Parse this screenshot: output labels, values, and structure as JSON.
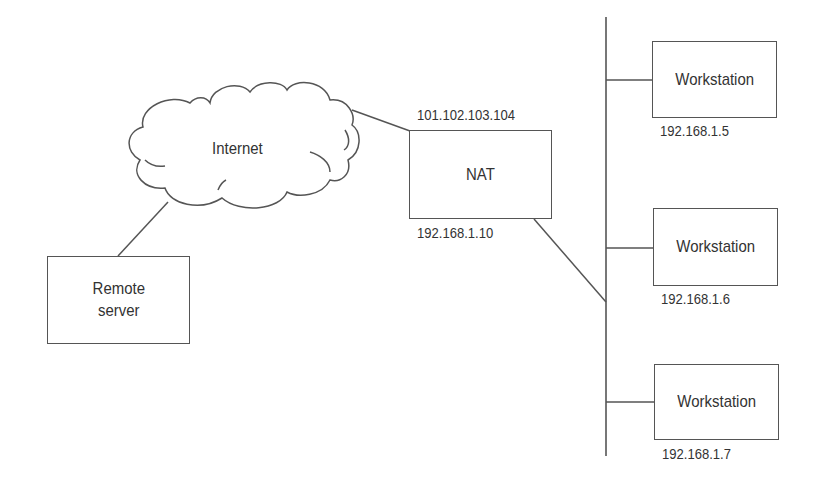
{
  "diagram": {
    "type": "network-topology",
    "cloud": {
      "label": "Internet"
    },
    "remote_server": {
      "label_line1": "Remote",
      "label_line2": "server"
    },
    "nat": {
      "label": "NAT",
      "public_ip": "101.102.103.104",
      "private_ip": "192.168.1.10"
    },
    "workstations": [
      {
        "label": "Workstation",
        "ip": "192.168.1.5"
      },
      {
        "label": "Workstation",
        "ip": "192.168.1.6"
      },
      {
        "label": "Workstation",
        "ip": "192.168.1.7"
      }
    ],
    "connections": [
      {
        "from": "Remote server",
        "to": "Internet"
      },
      {
        "from": "Internet",
        "to": "NAT"
      },
      {
        "from": "NAT",
        "to": "LAN bus"
      },
      {
        "from": "LAN bus",
        "to": "Workstation 192.168.1.5"
      },
      {
        "from": "LAN bus",
        "to": "Workstation 192.168.1.6"
      },
      {
        "from": "LAN bus",
        "to": "Workstation 192.168.1.7"
      }
    ],
    "colors": {
      "stroke": "#555555",
      "text": "#333333",
      "background": "#ffffff"
    }
  }
}
